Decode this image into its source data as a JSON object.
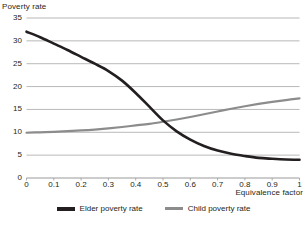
{
  "chart_data": {
    "type": "line",
    "title": "",
    "xlabel": "Equivalence factor",
    "ylabel": "Poverty rate",
    "xlim": [
      0,
      1
    ],
    "ylim": [
      0,
      35
    ],
    "grid": true,
    "legend_position": "bottom",
    "x_ticks": [
      "0",
      "0.1",
      "0.2",
      "0.3",
      "0.4",
      "0.5",
      "0.6",
      "0.7",
      "0.8",
      "0.9",
      "1"
    ],
    "y_ticks": [
      "0",
      "5",
      "10",
      "15",
      "20",
      "25",
      "30",
      "35"
    ],
    "x": [
      0,
      0.05,
      0.1,
      0.15,
      0.2,
      0.25,
      0.3,
      0.35,
      0.4,
      0.45,
      0.5,
      0.55,
      0.6,
      0.65,
      0.7,
      0.75,
      0.8,
      0.85,
      0.9,
      0.95,
      1
    ],
    "series": [
      {
        "name": "Elder poverty rate",
        "color": "#231f20",
        "width": 2.6,
        "values": [
          32.0,
          30.8,
          29.4,
          28.0,
          26.5,
          25.0,
          23.4,
          21.3,
          18.6,
          15.6,
          12.6,
          10.2,
          8.4,
          7.0,
          6.0,
          5.3,
          4.8,
          4.4,
          4.2,
          4.05,
          4.0
        ]
      },
      {
        "name": "Child poverty rate",
        "color": "#8c8c8c",
        "width": 2.2,
        "values": [
          9.9,
          10.0,
          10.1,
          10.25,
          10.4,
          10.6,
          10.85,
          11.15,
          11.5,
          11.85,
          12.3,
          12.8,
          13.35,
          13.95,
          14.55,
          15.15,
          15.7,
          16.2,
          16.65,
          17.05,
          17.4
        ]
      }
    ],
    "annotations": {
      "crossover_x": 0.49,
      "crossover_y": 12.2
    }
  },
  "legend": {
    "entries": [
      {
        "label": "Elder poverty rate",
        "color": "#231f20"
      },
      {
        "label": "Child poverty rate",
        "color": "#8c8c8c"
      }
    ]
  },
  "footer": {
    "cut_off_text": ""
  }
}
